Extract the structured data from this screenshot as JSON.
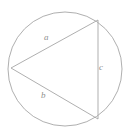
{
  "figure": {
    "name": "triangle-inscribed-in-circle",
    "background_color": "#ffffff",
    "stroke_color": "#a6a6a6",
    "label_color": "#8f8f8f",
    "stroke_width": 0.9,
    "circle": {
      "center_x": 65,
      "center_y": 69,
      "radius": 57
    },
    "triangle": {
      "vertices": [
        {
          "name": "left-vertex",
          "x": 11,
          "y": 68
        },
        {
          "name": "top-right-vertex",
          "x": 98,
          "y": 20
        },
        {
          "name": "bottom-right-vertex",
          "x": 98,
          "y": 119
        }
      ]
    },
    "labels": {
      "a": "a",
      "b": "b",
      "c": "c"
    }
  }
}
